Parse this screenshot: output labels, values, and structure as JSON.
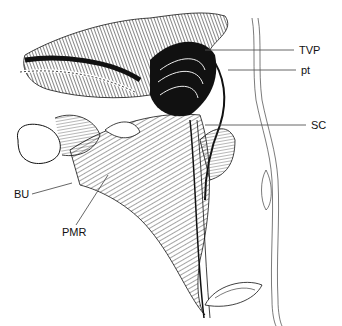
{
  "figure": {
    "labels": [
      {
        "id": "TVP",
        "text": "TVP",
        "x": 299,
        "y": 53,
        "line": {
          "x1": 205,
          "y1": 50,
          "x2": 294,
          "y2": 50
        }
      },
      {
        "id": "pt",
        "text": "pt",
        "x": 301,
        "y": 74,
        "line": {
          "x1": 228,
          "y1": 70,
          "x2": 296,
          "y2": 70
        }
      },
      {
        "id": "SC",
        "text": "SC",
        "x": 311,
        "y": 129,
        "line": {
          "x1": 205,
          "y1": 125,
          "x2": 306,
          "y2": 125
        }
      },
      {
        "id": "BU",
        "text": "BU",
        "x": 14,
        "y": 198,
        "line": {
          "x1": 32,
          "y1": 194,
          "x2": 72,
          "y2": 183
        }
      },
      {
        "id": "PMR",
        "text": "PMR",
        "x": 62,
        "y": 236,
        "line": {
          "x1": 76,
          "y1": 225,
          "x2": 108,
          "y2": 175
        }
      }
    ]
  }
}
